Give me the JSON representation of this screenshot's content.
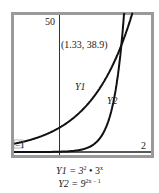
{
  "chart_data": {
    "type": "line",
    "title": "",
    "xlabel": "",
    "ylabel": "",
    "xlim": [
      -1,
      2
    ],
    "ylim": [
      0,
      50
    ],
    "grid": false,
    "axis_labels": {
      "x_min": "−1",
      "x_max": "2",
      "y_max": "50"
    },
    "series": [
      {
        "name": "Y1",
        "formula": "Y1 = 3^2 • 3^x",
        "x": [
          -1,
          -0.5,
          0,
          0.5,
          1,
          1.33,
          1.5,
          1.7
        ],
        "values": [
          3,
          5.2,
          9,
          15.6,
          27,
          38.9,
          46.8,
          58.8
        ]
      },
      {
        "name": "Y2",
        "formula": "Y2 = 9^(2x − 1)",
        "x": [
          -1,
          0,
          0.5,
          0.8,
          1,
          1.2,
          1.33,
          1.45
        ],
        "values": [
          0.0014,
          0.111,
          1,
          3.74,
          9,
          21.7,
          38.9,
          65.1
        ]
      }
    ],
    "annotations": [
      {
        "text": "(1.33, 38.9)",
        "x": 1.33,
        "y": 38.9,
        "type": "intersection"
      }
    ],
    "legend": "inline curve labels"
  },
  "labels": {
    "y_max": "50",
    "x_min": "−1",
    "x_max": "2",
    "intersection": "(1.33, 38.9)",
    "y1_curve": "Y1",
    "y2_curve": "Y2"
  },
  "formulas": {
    "y1_lhs": "Y1 = 3",
    "y1_exp1": "2",
    "y1_mid": " • 3",
    "y1_exp2": "x",
    "y2_lhs": "Y2 = 9",
    "y2_exp": "2x − 1"
  },
  "colors": {
    "frame": "#9a9a9a",
    "curve": "#111111",
    "axis": "#333333"
  }
}
